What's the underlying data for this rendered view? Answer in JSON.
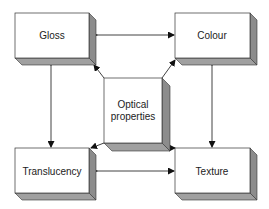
{
  "diagram": {
    "center": {
      "label_line1": "Optical",
      "label_line2": "properties"
    },
    "nodes": {
      "gloss": {
        "label": "Gloss"
      },
      "colour": {
        "label": "Colour"
      },
      "translucency": {
        "label": "Translucency"
      },
      "texture": {
        "label": "Texture"
      }
    },
    "colors": {
      "face": "#ffffff",
      "side": "#8c8c8c",
      "bottom": "#a0a0a0",
      "stroke": "#333333",
      "arrow": "#111111"
    }
  }
}
